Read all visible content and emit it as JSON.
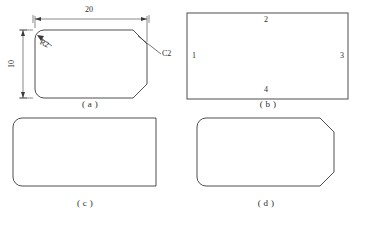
{
  "figure": {
    "background_color": "#ffffff",
    "stroke_color": "#3a3a3a",
    "text_color": "#2b2b2b"
  },
  "panels": [
    {
      "id": "a",
      "caption": "( a )",
      "shape": "rounded-left-chamfered-right-rectangle",
      "dimensions": [
        {
          "name": "width",
          "value": "20",
          "orientation": "horizontal"
        },
        {
          "name": "height",
          "value": "10",
          "orientation": "vertical"
        }
      ],
      "annotations": [
        {
          "name": "fillet-radius",
          "value": "R2"
        },
        {
          "name": "chamfer",
          "value": "C2"
        }
      ]
    },
    {
      "id": "b",
      "caption": "( b )",
      "shape": "plain-rectangle",
      "edge_labels": [
        {
          "position": "left",
          "value": "1"
        },
        {
          "position": "top",
          "value": "2"
        },
        {
          "position": "right",
          "value": "3"
        },
        {
          "position": "bottom",
          "value": "4"
        }
      ]
    },
    {
      "id": "c",
      "caption": "( c )",
      "shape": "rounded-left-rectangle"
    },
    {
      "id": "d",
      "caption": "( d )",
      "shape": "rounded-left-chamfered-right-rectangle"
    }
  ]
}
